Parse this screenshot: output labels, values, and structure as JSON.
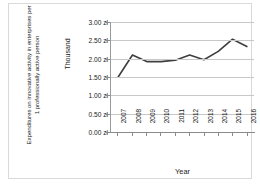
{
  "chart_data": {
    "type": "line",
    "title": "",
    "ylabel": "Expenditures on innovative activity in enterprises per 1 professionally active person",
    "y_unit_label": "Thousand",
    "xlabel": "Year",
    "categories": [
      "2007",
      "2008",
      "2009",
      "2010",
      "2011",
      "2012",
      "2013",
      "2014",
      "2015",
      "2016"
    ],
    "values": [
      1.5,
      2.1,
      1.92,
      1.92,
      1.96,
      2.1,
      1.97,
      2.2,
      2.53,
      2.33
    ],
    "ylim": [
      0.0,
      3.0
    ],
    "ytick_values": [
      0.0,
      0.5,
      1.0,
      1.5,
      2.0,
      2.5,
      3.0
    ],
    "ytick_labels": [
      "0.00 zł",
      "0.50 zł",
      "1.00 zł",
      "1.50 zł",
      "2.00 zł",
      "2.50 zł",
      "3.00 zł"
    ],
    "grid": true,
    "legend": "none",
    "series_color": "#3f3f3f",
    "grid_color": "#c8c8c8",
    "axis_color": "#8a8a8a",
    "border_color": "#d9d9d9"
  }
}
